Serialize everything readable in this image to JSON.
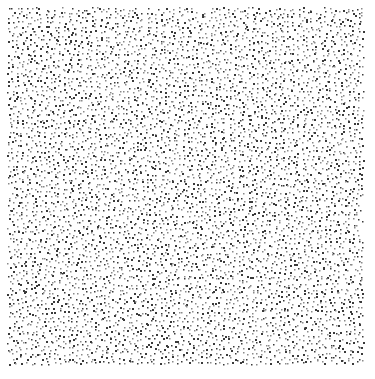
{
  "image": {
    "kind": "stipple-texture",
    "description": "Uniform blue-noise stippled dot field on white background",
    "background_color": "#ffffff",
    "dot_color": "#3a3a3a",
    "dot_color_light": "#8a8a8a",
    "seed": 1337
  }
}
